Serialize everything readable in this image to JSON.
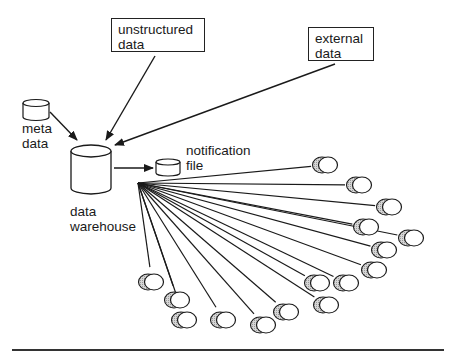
{
  "diagram": {
    "title": "",
    "nodes": [
      {
        "id": "unstructured",
        "label_lines": [
          "unstructured",
          "data"
        ],
        "shape": "box"
      },
      {
        "id": "external",
        "label_lines": [
          "external",
          "data"
        ],
        "shape": "box"
      },
      {
        "id": "meta",
        "label_lines": [
          "meta",
          "data"
        ],
        "shape": "cylinder-small"
      },
      {
        "id": "warehouse",
        "label_lines": [
          "data",
          "warehouse"
        ],
        "shape": "cylinder-large"
      },
      {
        "id": "notification",
        "label_lines": [
          "notification",
          "file"
        ],
        "shape": "cylinder-small"
      }
    ],
    "edges": [
      {
        "from": "unstructured",
        "to": "warehouse",
        "arrow": true
      },
      {
        "from": "external",
        "to": "warehouse",
        "arrow": true
      },
      {
        "from": "meta",
        "to": "warehouse",
        "arrow": true
      },
      {
        "from": "warehouse",
        "to": "notification",
        "arrow": true
      }
    ],
    "fanout": {
      "from": "warehouse",
      "count": 16,
      "target_shape": "disk-pair-icon",
      "origin": [
        138,
        183
      ],
      "targets": [
        [
          326,
          165
        ],
        [
          360,
          185
        ],
        [
          390,
          207
        ],
        [
          367,
          227
        ],
        [
          412,
          238
        ],
        [
          385,
          250
        ],
        [
          375,
          270
        ],
        [
          347,
          283
        ],
        [
          318,
          283
        ],
        [
          327,
          305
        ],
        [
          287,
          312
        ],
        [
          264,
          325
        ],
        [
          224,
          320
        ],
        [
          185,
          320
        ],
        [
          178,
          300
        ],
        [
          152,
          282
        ]
      ]
    }
  },
  "labels": {
    "unstructured": "unstructured\ndata",
    "external": "external\ndata",
    "meta": "meta\ndata",
    "warehouse": "data\nwarehouse",
    "notification": "notification\nfile"
  },
  "colors": {
    "stroke": "#1a1a1a",
    "disk_shade": "#c8c8c8",
    "background": "#ffffff"
  }
}
